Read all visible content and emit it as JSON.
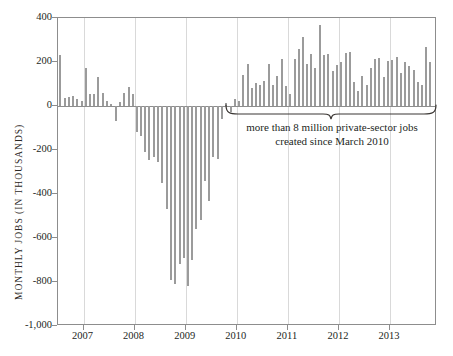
{
  "chart_data": {
    "type": "bar",
    "title": "",
    "subtitle": "",
    "xlabel": "",
    "ylabel": "MONTHLY JOBS (IN THOUSANDS)",
    "ylim": [
      -1000,
      400
    ],
    "xlim": [
      2006.5,
      2013.92
    ],
    "grid": "vertical-only",
    "legend": "none",
    "bar_color": "#9b9b9b",
    "y_ticks": [
      400,
      200,
      0,
      -200,
      -400,
      -600,
      -800,
      -1000
    ],
    "y_tick_labels": [
      "400",
      "200",
      "0",
      "-200",
      "-400",
      "-600",
      "-800",
      "-1,000"
    ],
    "x_ticks": [
      2007,
      2008,
      2009,
      2010,
      2011,
      2012,
      2013
    ],
    "x_tick_labels": [
      "2007",
      "2008",
      "2009",
      "2010",
      "2011",
      "2012",
      "2013"
    ],
    "annotations": [
      {
        "name": "brace-annotation",
        "text_line_1": "more than 8 million private-sector jobs",
        "text_line_2": "created since March 2010",
        "brace_start_x": 2009.83,
        "brace_end_x": 2013.92
      }
    ],
    "x": [
      2006.54,
      2006.63,
      2006.71,
      2006.79,
      2006.88,
      2006.96,
      2007.04,
      2007.13,
      2007.21,
      2007.29,
      2007.38,
      2007.46,
      2007.54,
      2007.63,
      2007.71,
      2007.79,
      2007.88,
      2007.96,
      2008.04,
      2008.13,
      2008.21,
      2008.29,
      2008.38,
      2008.46,
      2008.54,
      2008.63,
      2008.71,
      2008.79,
      2008.88,
      2008.96,
      2009.04,
      2009.13,
      2009.21,
      2009.29,
      2009.38,
      2009.46,
      2009.54,
      2009.63,
      2009.71,
      2009.79,
      2009.88,
      2009.96,
      2010.04,
      2010.13,
      2010.21,
      2010.29,
      2010.38,
      2010.46,
      2010.54,
      2010.63,
      2010.71,
      2010.79,
      2010.88,
      2010.96,
      2011.04,
      2011.13,
      2011.21,
      2011.29,
      2011.38,
      2011.46,
      2011.54,
      2011.63,
      2011.71,
      2011.79,
      2011.88,
      2011.96,
      2012.04,
      2012.13,
      2012.21,
      2012.29,
      2012.38,
      2012.46,
      2012.54,
      2012.63,
      2012.71,
      2012.79,
      2012.88,
      2012.96,
      2013.04,
      2013.13,
      2013.21,
      2013.29,
      2013.38,
      2013.46,
      2013.54,
      2013.63,
      2013.71,
      2013.79
    ],
    "values": [
      230,
      35,
      40,
      45,
      30,
      25,
      175,
      55,
      55,
      130,
      60,
      25,
      10,
      -70,
      20,
      60,
      85,
      55,
      -120,
      -135,
      -210,
      -245,
      -230,
      -255,
      -350,
      -470,
      -790,
      -810,
      -720,
      -690,
      -820,
      -700,
      -560,
      -520,
      -340,
      -430,
      -230,
      -240,
      -60,
      15,
      -25,
      30,
      25,
      140,
      190,
      80,
      105,
      95,
      115,
      190,
      95,
      135,
      215,
      90,
      55,
      215,
      260,
      315,
      190,
      235,
      175,
      370,
      230,
      235,
      160,
      185,
      200,
      240,
      245,
      110,
      70,
      135,
      95,
      175,
      215,
      220,
      130,
      205,
      210,
      225,
      150,
      200,
      180,
      165,
      110,
      95,
      270,
      200
    ]
  }
}
